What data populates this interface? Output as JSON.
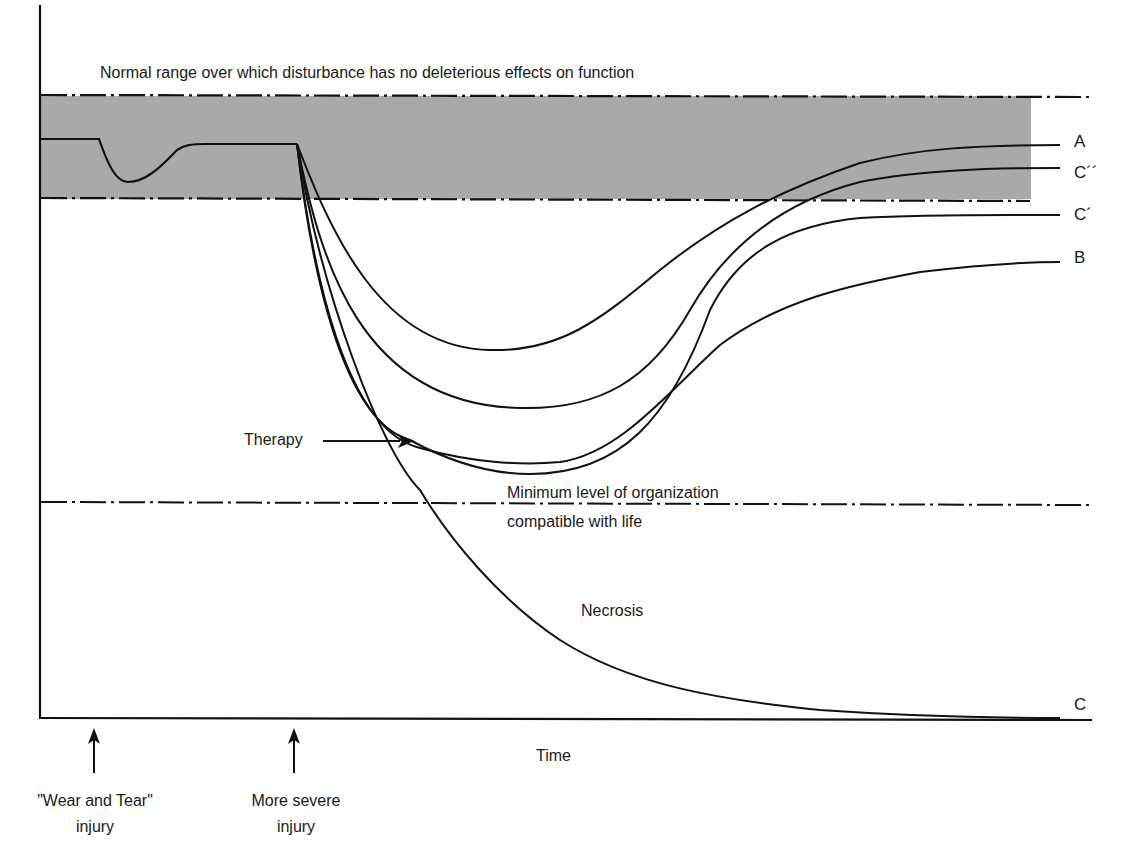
{
  "figure": {
    "band_title": "Normal range over which disturbance has no deleterious effects on function",
    "min_level_line1": "Minimum level of organization",
    "min_level_line2": "compatible with life",
    "therapy_label": "Therapy",
    "necrosis_label": "Necrosis",
    "x_axis_label": "Time",
    "events": [
      {
        "label_line1": "\"Wear and Tear\"",
        "label_line2": "injury"
      },
      {
        "label_line1": "More severe",
        "label_line2": "injury"
      }
    ],
    "curve_labels": {
      "A": "A",
      "C_double_prime": "C´´",
      "C_prime": "C´",
      "B": "B",
      "C": "C"
    },
    "colors": {
      "band_fill": "#a9a9a9",
      "line": "#111111",
      "background": "#ffffff"
    }
  }
}
